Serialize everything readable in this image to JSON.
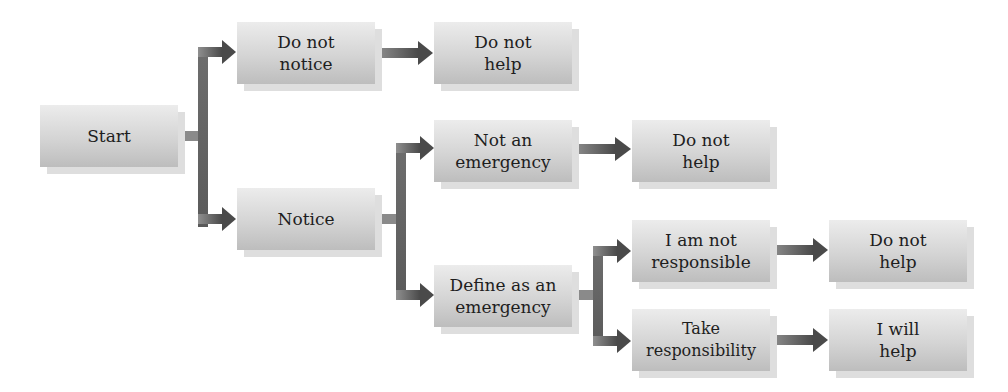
{
  "diagram": {
    "type": "flowchart",
    "colors": {
      "box_top": "#ececec",
      "box_bottom": "#bdbdbd",
      "shadow": "#dedede",
      "arrow": "#555555",
      "text": "#1e1e1e"
    },
    "nodes": {
      "start": {
        "label": "Start"
      },
      "do_not_notice": {
        "label": "Do not notice"
      },
      "do_not_help_1": {
        "label": "Do not help"
      },
      "notice": {
        "label": "Notice"
      },
      "not_emergency": {
        "label": "Not an emergency"
      },
      "do_not_help_2": {
        "label": "Do not help"
      },
      "define_emergency": {
        "label": "Define as an emergency"
      },
      "not_responsible": {
        "label": "I am not responsible"
      },
      "do_not_help_3": {
        "label": "Do not help"
      },
      "take_responsibility": {
        "label": "Take responsibility"
      },
      "will_help": {
        "label": "I will help"
      }
    },
    "edges": [
      [
        "start",
        "do_not_notice"
      ],
      [
        "start",
        "notice"
      ],
      [
        "do_not_notice",
        "do_not_help_1"
      ],
      [
        "notice",
        "not_emergency"
      ],
      [
        "notice",
        "define_emergency"
      ],
      [
        "not_emergency",
        "do_not_help_2"
      ],
      [
        "define_emergency",
        "not_responsible"
      ],
      [
        "define_emergency",
        "take_responsibility"
      ],
      [
        "not_responsible",
        "do_not_help_3"
      ],
      [
        "take_responsibility",
        "will_help"
      ]
    ]
  }
}
